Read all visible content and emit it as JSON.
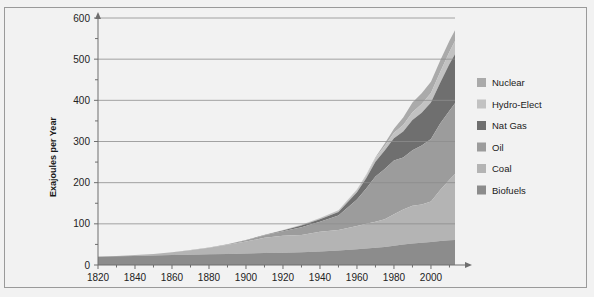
{
  "chart_data": {
    "type": "area",
    "title": "",
    "xlabel": "",
    "ylabel": "Exajoules per Year",
    "stacked": true,
    "grid": true,
    "legend_position": "right",
    "xlim": [
      1820,
      2013
    ],
    "ylim": [
      0,
      600
    ],
    "xticks": [
      1820,
      1840,
      1860,
      1880,
      1900,
      1920,
      1940,
      1960,
      1980,
      2000
    ],
    "yticks": [
      0,
      100,
      200,
      300,
      400,
      500,
      600
    ],
    "yminor_step": 50,
    "x": [
      1820,
      1830,
      1840,
      1850,
      1860,
      1870,
      1880,
      1890,
      1900,
      1910,
      1920,
      1930,
      1940,
      1950,
      1960,
      1965,
      1970,
      1975,
      1980,
      1985,
      1990,
      1995,
      2000,
      2005,
      2010,
      2013
    ],
    "series": [
      {
        "name": "Biofuels",
        "color": "#8c8c8c",
        "values": [
          20,
          21,
          22,
          23,
          24,
          25,
          26,
          27,
          28,
          29,
          30,
          31,
          33,
          35,
          38,
          40,
          42,
          44,
          47,
          50,
          52,
          54,
          56,
          58,
          60,
          61
        ]
      },
      {
        "name": "Coal",
        "color": "#b4b4b4",
        "values": [
          0.5,
          1,
          2,
          4,
          7,
          11,
          16,
          22,
          29,
          37,
          41,
          42,
          48,
          50,
          57,
          60,
          63,
          67,
          76,
          85,
          92,
          93,
          98,
          124,
          147,
          160
        ]
      },
      {
        "name": "Oil",
        "color": "#9c9c9c",
        "values": [
          0,
          0,
          0,
          0,
          0,
          0.3,
          0.8,
          1.5,
          3,
          6,
          11,
          19,
          24,
          35,
          64,
          86,
          110,
          122,
          131,
          126,
          135,
          143,
          152,
          162,
          168,
          172
        ]
      },
      {
        "name": "Nat Gas",
        "color": "#6f6f6f",
        "values": [
          0,
          0,
          0,
          0,
          0,
          0,
          0,
          0.2,
          0.5,
          1,
          2,
          4,
          6,
          9,
          18,
          25,
          36,
          45,
          54,
          63,
          73,
          80,
          89,
          99,
          113,
          119
        ]
      },
      {
        "name": "Hydro-Elect",
        "color": "#c2c2c2",
        "values": [
          0,
          0,
          0,
          0,
          0,
          0,
          0,
          0,
          0.2,
          0.5,
          1,
          2,
          3,
          4,
          6,
          7,
          9,
          11,
          13,
          16,
          19,
          21,
          23,
          26,
          30,
          32
        ]
      },
      {
        "name": "Nuclear",
        "color": "#aaaaaa",
        "values": [
          0,
          0,
          0,
          0,
          0,
          0,
          0,
          0,
          0,
          0,
          0,
          0,
          0,
          0,
          0.5,
          1,
          2,
          6,
          10,
          18,
          24,
          26,
          27,
          28,
          27,
          26
        ]
      }
    ],
    "legend_order_top_to_bottom": [
      "Nuclear",
      "Hydro-Elect",
      "Nat Gas",
      "Oil",
      "Coal",
      "Biofuels"
    ],
    "peak_total": 545
  },
  "colors": {
    "background": "#f2f2f2",
    "frame_border": "#9a9a9a",
    "gridline": "#8d8d8d",
    "axis": "#6e6e6e",
    "text": "#1a1a1a"
  }
}
